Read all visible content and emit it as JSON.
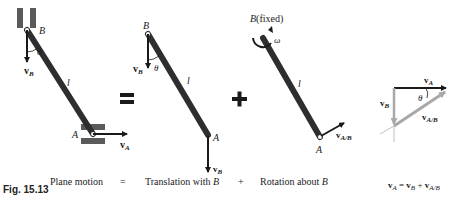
{
  "figure": {
    "number": "Fig. 15.13",
    "captions": {
      "plane_motion": "Plane motion",
      "equals": "=",
      "translation": "Translation with ",
      "translation_point": "B",
      "plus": "+",
      "rotation": "Rotation about ",
      "rotation_point": "B",
      "equation_lhs": "v",
      "equation_lhs_sub": "A",
      "equation_eq": " = ",
      "equation_t1": "v",
      "equation_t1_sub": "B",
      "equation_plus": " + ",
      "equation_t2": "v",
      "equation_t2_sub": "A/B"
    },
    "panel_plane": {
      "point_b": "B",
      "point_a": "A",
      "length": "l",
      "angle": "θ",
      "vel_b": "v",
      "vel_b_sub": "B",
      "vel_a": "v",
      "vel_a_sub": "A"
    },
    "panel_translation": {
      "point_b": "B",
      "point_a": "A",
      "length": "l",
      "angle": "θ",
      "vel_b_top": "v",
      "vel_b_top_sub": "B",
      "vel_b_bottom": "v",
      "vel_b_bottom_sub": "B"
    },
    "panel_rotation": {
      "point_b": "B",
      "fixed_note": "(fixed)",
      "omega": "ω",
      "length": "l",
      "point_a": "A",
      "vel_ab": "v",
      "vel_ab_sub": "A/B"
    },
    "vector_triangle": {
      "vel_a": "v",
      "vel_a_sub": "A",
      "vel_b": "v",
      "vel_b_sub": "B",
      "vel_ab": "v",
      "vel_ab_sub": "A/B",
      "angle": "θ"
    },
    "operators": {
      "equals": "=",
      "plus": "+"
    },
    "colors": {
      "rod": "#2e2e2e",
      "slider": "#5a5a5a",
      "vector_gray": "#a8a8a8",
      "ink": "#1a1a1a"
    }
  }
}
